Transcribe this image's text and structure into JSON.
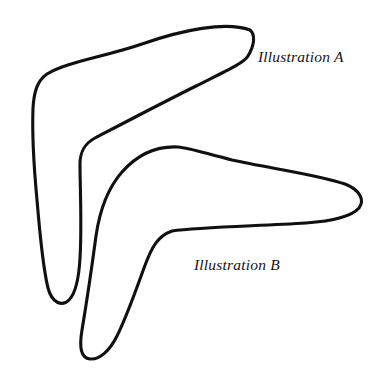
{
  "figure": {
    "background_color": "#ffffff",
    "ink_color": "#101010",
    "width": 386,
    "height": 381,
    "stroke_width": 3.1
  },
  "captions": {
    "a": "Illustration A",
    "b": "Illustration B"
  },
  "shapes": [
    {
      "id": "illustration-a",
      "name": "boomerang-a",
      "description": "Upper-left boomerang, arms pointing up-right and down",
      "tip_upper_right": [
        250,
        42
      ],
      "elbow_outer": [
        37,
        75
      ],
      "elbow_inner": [
        80,
        150
      ],
      "tip_lower": [
        52,
        302
      ],
      "path": "M 250 30 C 226 21, 182 30, 142 44 C 104 57, 66 62, 47 74 C 37 81, 34 92, 33 108 C 32 134, 34 168, 37 200 C 40 236, 44 272, 48 288 C 52 303, 62 307, 69 300 C 76 293, 79 276, 80 258 C 82 226, 80 186, 80 164 C 80 152, 84 144, 95 138 C 118 126, 160 104, 196 86 C 226 71, 244 63, 248 56 C 254 46, 256 35, 250 30 Z"
    },
    {
      "id": "illustration-b",
      "name": "boomerang-b",
      "description": "Lower-right boomerang, arms pointing right and down-left",
      "apex_top": [
        178,
        147
      ],
      "tip_right": [
        361,
        202
      ],
      "elbow_inner": [
        163,
        232
      ],
      "tip_lower_left": [
        86,
        356
      ],
      "path": "M 178 147 C 158 146, 138 154, 122 172 C 108 188, 100 208, 96 236 C 92 266, 86 306, 82 330 C 79 348, 81 358, 90 359 C 100 360, 110 350, 117 336 C 127 316, 136 290, 144 268 C 152 246, 158 236, 172 231 C 200 227, 260 226, 306 223 C 334 221, 352 216, 359 208 C 365 200, 360 190, 345 184 C 320 175, 268 168, 232 160 C 204 153, 190 148, 178 147 Z"
    }
  ]
}
